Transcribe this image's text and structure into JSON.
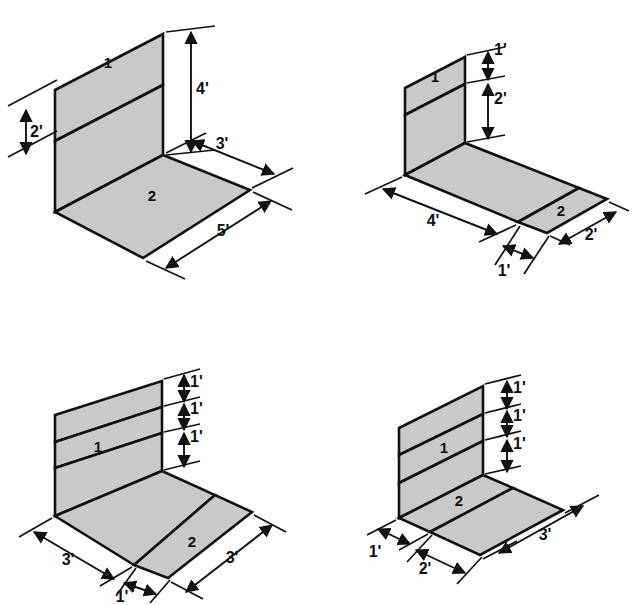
{
  "sheet": {
    "title": "Isometric surface-area diagrams",
    "background_color": "#ffffff",
    "ink_color": "#121212",
    "fill_color": "#c9c9c9",
    "figure_count": 4
  },
  "figures": [
    {
      "id": "top-left",
      "position": "top-left",
      "regions": [
        {
          "label": "1",
          "surface": "wall"
        },
        {
          "label": "2",
          "surface": "floor"
        }
      ],
      "dimensions": [
        {
          "label": "2'",
          "value": 2,
          "unit": "ft",
          "edge": "wall-left-lower",
          "orientation": "vertical"
        },
        {
          "label": "4'",
          "value": 4,
          "unit": "ft",
          "edge": "wall-right-height",
          "orientation": "vertical"
        },
        {
          "label": "3'",
          "value": 3,
          "unit": "ft",
          "edge": "floor-back-right",
          "orientation": "diagonal"
        },
        {
          "label": "5'",
          "value": 5,
          "unit": "ft",
          "edge": "floor-front-right",
          "orientation": "diagonal"
        }
      ]
    },
    {
      "id": "top-right",
      "position": "top-right",
      "regions": [
        {
          "label": "1",
          "surface": "wall"
        },
        {
          "label": "2",
          "surface": "floor"
        }
      ],
      "dimensions": [
        {
          "label": "1'",
          "value": 1,
          "unit": "ft",
          "edge": "wall-top-band",
          "orientation": "vertical"
        },
        {
          "label": "2'",
          "value": 2,
          "unit": "ft",
          "edge": "wall-lower-height",
          "orientation": "vertical"
        },
        {
          "label": "4'",
          "value": 4,
          "unit": "ft",
          "edge": "floor-front-left",
          "orientation": "diagonal"
        },
        {
          "label": "1'",
          "value": 1,
          "unit": "ft",
          "edge": "floor-front-middle",
          "orientation": "diagonal"
        },
        {
          "label": "2'",
          "value": 2,
          "unit": "ft",
          "edge": "floor-front-right",
          "orientation": "diagonal"
        }
      ]
    },
    {
      "id": "bottom-left",
      "position": "bottom-left",
      "regions": [
        {
          "label": "1",
          "surface": "wall"
        },
        {
          "label": "2",
          "surface": "floor"
        }
      ],
      "dimensions": [
        {
          "label": "1'",
          "value": 1,
          "unit": "ft",
          "edge": "wall-band-top",
          "orientation": "vertical"
        },
        {
          "label": "1'",
          "value": 1,
          "unit": "ft",
          "edge": "wall-band-middle",
          "orientation": "vertical"
        },
        {
          "label": "1'",
          "value": 1,
          "unit": "ft",
          "edge": "wall-band-bottom",
          "orientation": "vertical"
        },
        {
          "label": "3'",
          "value": 3,
          "unit": "ft",
          "edge": "floor-front-left",
          "orientation": "diagonal"
        },
        {
          "label": "1'",
          "value": 1,
          "unit": "ft",
          "edge": "floor-front-middle",
          "orientation": "diagonal"
        },
        {
          "label": "3'",
          "value": 3,
          "unit": "ft",
          "edge": "floor-front-right",
          "orientation": "diagonal"
        }
      ]
    },
    {
      "id": "bottom-right",
      "position": "bottom-right",
      "regions": [
        {
          "label": "1",
          "surface": "wall"
        },
        {
          "label": "2",
          "surface": "floor"
        }
      ],
      "dimensions": [
        {
          "label": "1'",
          "value": 1,
          "unit": "ft",
          "edge": "wall-band-top",
          "orientation": "vertical"
        },
        {
          "label": "1'",
          "value": 1,
          "unit": "ft",
          "edge": "wall-band-middle",
          "orientation": "vertical"
        },
        {
          "label": "1'",
          "value": 1,
          "unit": "ft",
          "edge": "wall-band-bottom",
          "orientation": "vertical"
        },
        {
          "label": "1'",
          "value": 1,
          "unit": "ft",
          "edge": "floor-front-left",
          "orientation": "diagonal"
        },
        {
          "label": "2'",
          "value": 2,
          "unit": "ft",
          "edge": "floor-front-middle",
          "orientation": "diagonal"
        },
        {
          "label": "3'",
          "value": 3,
          "unit": "ft",
          "edge": "floor-front-right",
          "orientation": "diagonal"
        }
      ]
    }
  ],
  "labels": {
    "tl_region1": "1",
    "tl_region2": "2",
    "tl_dim_2ft": "2'",
    "tl_dim_4ft": "4'",
    "tl_dim_3ft": "3'",
    "tl_dim_5ft": "5'",
    "tr_region1": "1",
    "tr_region2": "2",
    "tr_dim_1ft_wall": "1'",
    "tr_dim_2ft_wall": "2'",
    "tr_dim_4ft": "4'",
    "tr_dim_1ft_floor": "1'",
    "tr_dim_2ft_floor": "2'",
    "bl_region1": "1",
    "bl_region2": "2",
    "bl_dim_1ft_a": "1'",
    "bl_dim_1ft_b": "1'",
    "bl_dim_1ft_c": "1'",
    "bl_dim_3ft_left": "3'",
    "bl_dim_1ft_mid": "1'",
    "bl_dim_3ft_right": "3'",
    "br_region1": "1",
    "br_region2": "2",
    "br_dim_1ft_a": "1'",
    "br_dim_1ft_b": "1'",
    "br_dim_1ft_c": "1'",
    "br_dim_1ft_left": "1'",
    "br_dim_2ft_mid": "2'",
    "br_dim_3ft_right": "3'"
  }
}
